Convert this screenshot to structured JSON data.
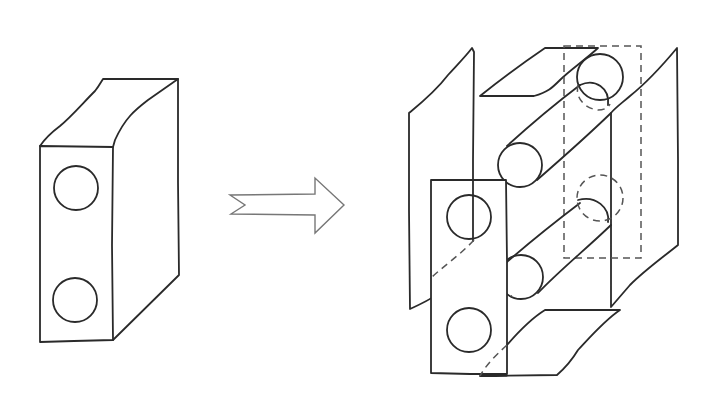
{
  "diagram": {
    "description": "Hand-drawn sketch: a rectangular block with two circular holes on its front face transforms (arrow) into an exploded view of its faces showing the two holes as cylindrical channels passing through the block",
    "left_figure": {
      "label": "solid-block",
      "front_face_holes": 2
    },
    "transition": {
      "label": "transform-arrow",
      "direction": "right"
    },
    "right_figure": {
      "label": "exploded-block",
      "panels": [
        "left-side-panel",
        "top-panel",
        "front-panel",
        "back-panel-dashed",
        "right-side-panel",
        "bottom-panel"
      ],
      "channels": 2
    },
    "colors": {
      "line": "#2a2a2a",
      "arrow_outline": "#777777",
      "dashed": "#555555",
      "background": "#ffffff"
    }
  }
}
